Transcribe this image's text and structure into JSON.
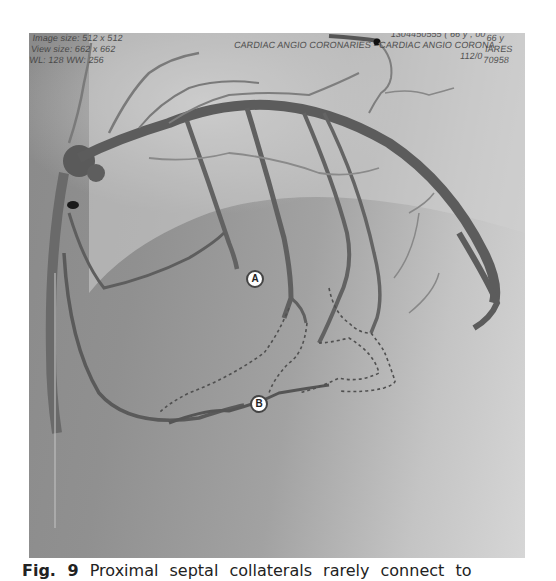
{
  "figure": {
    "type": "coronary angiogram",
    "overlay": {
      "top_left_lines": [
        "Image size: 512 x 512",
        "View size: 662 x 662",
        "WL: 128 WW: 256"
      ],
      "top_center_line": "CARDIAC ANGIO CORONARIES - CARDIAC ANGIO CORONA",
      "top_right_lines": [
        "1304450555 ( 66 y , 00",
        "112/0"
      ],
      "right_edge_lines": [
        "66 y",
        "IARES",
        "70958"
      ]
    },
    "annotations": [
      {
        "id": "A",
        "label": "A"
      },
      {
        "id": "B",
        "label": "B"
      }
    ]
  },
  "caption": {
    "figure_label": "Fig. 9",
    "text": " Proximal septal collaterals rarely connect to"
  }
}
